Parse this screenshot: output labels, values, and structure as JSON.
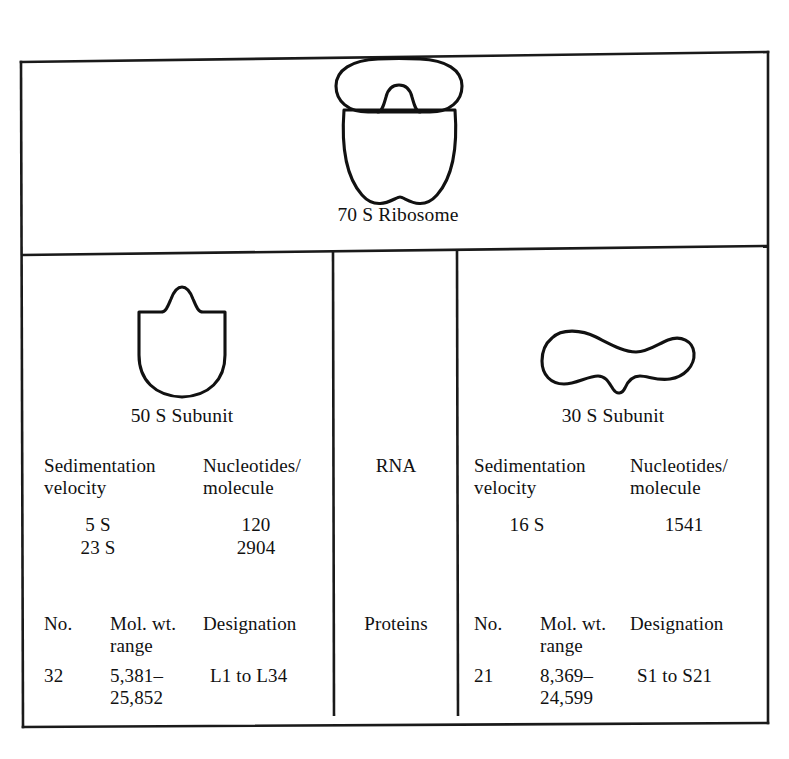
{
  "figure": {
    "name": "ribosome-composition-table",
    "whole_ribosome": {
      "caption": "70 S Ribosome",
      "shape": "ribosome-70s-shape"
    },
    "center_column": {
      "rna_label": "RNA",
      "proteins_label": "Proteins"
    },
    "subunits": [
      {
        "id": "50s",
        "caption": "50 S Subunit",
        "shape": "subunit-50s-shape",
        "rna": {
          "headers": [
            "Sedimentation velocity",
            "Nucleotides/ molecule"
          ],
          "header_lines": [
            [
              "Sedimentation",
              "velocity"
            ],
            [
              "Nucleotides/",
              "molecule"
            ]
          ],
          "rows": [
            [
              "5 S",
              "120"
            ],
            [
              "23 S",
              "2904"
            ]
          ]
        },
        "proteins": {
          "headers": [
            "No.",
            "Mol. wt. range",
            "Designation"
          ],
          "header_lines": [
            [
              "No."
            ],
            [
              "Mol. wt.",
              "range"
            ],
            [
              "Designation"
            ]
          ],
          "rows": [
            [
              "32",
              [
                "5,381–",
                "25,852"
              ],
              "L1 to L34"
            ]
          ]
        }
      },
      {
        "id": "30s",
        "caption": "30 S Subunit",
        "shape": "subunit-30s-shape",
        "rna": {
          "headers": [
            "Sedimentation velocity",
            "Nucleotides/ molecule"
          ],
          "header_lines": [
            [
              "Sedimentation",
              "velocity"
            ],
            [
              "Nucleotides/",
              "molecule"
            ]
          ],
          "rows": [
            [
              "16 S",
              "1541"
            ]
          ]
        },
        "proteins": {
          "headers": [
            "No.",
            "Mol. wt. range",
            "Designation"
          ],
          "header_lines": [
            [
              "No."
            ],
            [
              "Mol. wt.",
              "range"
            ],
            [
              "Designation"
            ]
          ],
          "rows": [
            [
              "21",
              [
                "8,369–",
                "24,599"
              ],
              "S1 to S21"
            ]
          ]
        }
      }
    ],
    "colors": {
      "ink": "#111111",
      "background": "#ffffff",
      "rule": "#1a1a1a"
    }
  },
  "text": {
    "c70s_caption": "70 S Ribosome",
    "c50s_caption": "50 S Subunit",
    "c30s_caption": "30 S Subunit",
    "rna": "RNA",
    "proteins": "Proteins",
    "l50_sed_1": "Sedimentation",
    "l50_sed_2": "velocity",
    "l50_nuc_1": "Nucleotides/",
    "l50_nuc_2": "molecule",
    "l50_s1": "5 S",
    "l50_n1": "120",
    "l50_s2": "23 S",
    "l50_n2": "2904",
    "l50_no_h": "No.",
    "l50_mw_h1": "Mol. wt.",
    "l50_mw_h2": "range",
    "l50_des_h": "Designation",
    "l50_no_v": "32",
    "l50_mw_v1": "5,381–",
    "l50_mw_v2": "25,852",
    "l50_des_v": "L1 to L34",
    "l30_sed_1": "Sedimentation",
    "l30_sed_2": "velocity",
    "l30_nuc_1": "Nucleotides/",
    "l30_nuc_2": "molecule",
    "l30_s1": "16 S",
    "l30_n1": "1541",
    "l30_no_h": "No.",
    "l30_mw_h1": "Mol. wt.",
    "l30_mw_h2": "range",
    "l30_des_h": "Designation",
    "l30_no_v": "21",
    "l30_mw_v1": "8,369–",
    "l30_mw_v2": "24,599",
    "l30_des_v": "S1 to S21"
  }
}
